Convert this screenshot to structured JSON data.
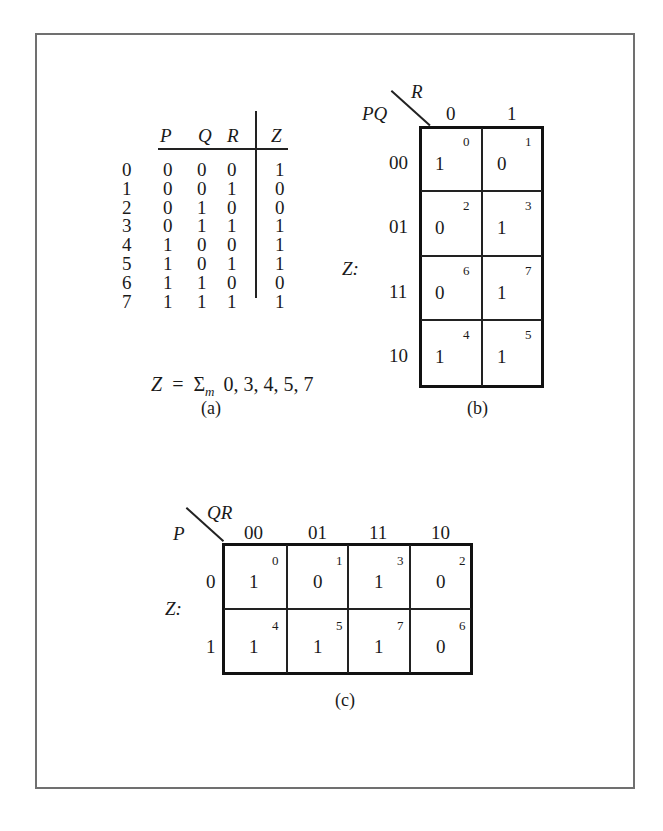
{
  "figure": {
    "frame_color": "#707070",
    "ink_color": "#1a1a1a"
  },
  "truth_table": {
    "headers": {
      "p": "P",
      "q": "Q",
      "r": "R",
      "z": "Z"
    },
    "rows": [
      {
        "index": "0",
        "p": "0",
        "q": "0",
        "r": "0",
        "z": "1"
      },
      {
        "index": "1",
        "p": "0",
        "q": "0",
        "r": "1",
        "z": "0"
      },
      {
        "index": "2",
        "p": "0",
        "q": "1",
        "r": "0",
        "z": "0"
      },
      {
        "index": "3",
        "p": "0",
        "q": "1",
        "r": "1",
        "z": "1"
      },
      {
        "index": "4",
        "p": "1",
        "q": "0",
        "r": "0",
        "z": "1"
      },
      {
        "index": "5",
        "p": "1",
        "q": "0",
        "r": "1",
        "z": "1"
      },
      {
        "index": "6",
        "p": "1",
        "q": "1",
        "r": "0",
        "z": "0"
      },
      {
        "index": "7",
        "p": "1",
        "q": "1",
        "r": "1",
        "z": "1"
      }
    ],
    "equation": {
      "lhs": "Z",
      "eq": "=",
      "sigma": "Σ",
      "sub": "m",
      "minterms": "0, 3, 4, 5, 7"
    },
    "caption": "(a)"
  },
  "kmap_b": {
    "row_var": "PQ",
    "col_var": "R",
    "function_label": "Z:",
    "col_headers": [
      "0",
      "1"
    ],
    "row_headers": [
      "00",
      "01",
      "11",
      "10"
    ],
    "cells": [
      [
        {
          "value": "1",
          "minterm": "0"
        },
        {
          "value": "0",
          "minterm": "1"
        }
      ],
      [
        {
          "value": "0",
          "minterm": "2"
        },
        {
          "value": "1",
          "minterm": "3"
        }
      ],
      [
        {
          "value": "0",
          "minterm": "6"
        },
        {
          "value": "1",
          "minterm": "7"
        }
      ],
      [
        {
          "value": "1",
          "minterm": "4"
        },
        {
          "value": "1",
          "minterm": "5"
        }
      ]
    ],
    "caption": "(b)"
  },
  "kmap_c": {
    "row_var": "P",
    "col_var": "QR",
    "function_label": "Z:",
    "col_headers": [
      "00",
      "01",
      "11",
      "10"
    ],
    "row_headers": [
      "0",
      "1"
    ],
    "cells": [
      [
        {
          "value": "1",
          "minterm": "0"
        },
        {
          "value": "0",
          "minterm": "1"
        },
        {
          "value": "1",
          "minterm": "3"
        },
        {
          "value": "0",
          "minterm": "2"
        }
      ],
      [
        {
          "value": "1",
          "minterm": "4"
        },
        {
          "value": "1",
          "minterm": "5"
        },
        {
          "value": "1",
          "minterm": "7"
        },
        {
          "value": "0",
          "minterm": "6"
        }
      ]
    ],
    "caption": "(c)"
  }
}
